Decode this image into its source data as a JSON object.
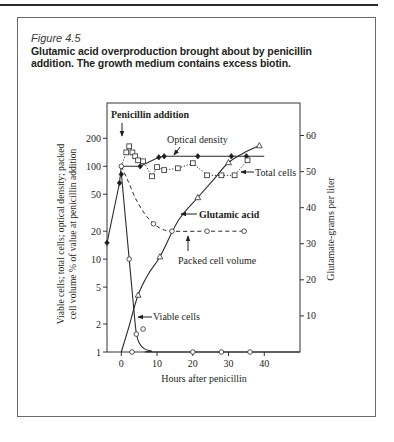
{
  "figure": {
    "label": "Figure 4.5",
    "caption_line1": "Glutamic acid overproduction brought about by penicillin",
    "caption_line2": "addition. The growth medium contains excess biotin."
  },
  "chart_data": {
    "type": "line",
    "title": "Glutamic acid overproduction brought about by penicillin addition. The growth medium contains excess biotin.",
    "xlabel": "Hours after penicillin",
    "ylabel": "Viable cells; total cells; optical density; packed cell volume % of value at penicillin addition",
    "ylabel_line1": "Viable cells; total cells; optical density; packed",
    "ylabel_line2": "cell volume % of value at penicillin addition",
    "y2label": "Glutamate-grams per liter",
    "xlim": [
      -4,
      50
    ],
    "xticks": [
      0,
      10,
      20,
      30,
      40
    ],
    "yscale": "log",
    "ylim": [
      1,
      480
    ],
    "yticks": [
      1,
      2,
      5,
      10,
      20,
      50,
      100,
      200
    ],
    "y2scale": "linear",
    "y2lim": [
      0,
      69
    ],
    "y2ticks": [
      10,
      20,
      30,
      40,
      50,
      60
    ],
    "grid": false,
    "legend": "inline annotations",
    "series": [
      {
        "name": "Optical density",
        "axis": "left",
        "marker": "filled-diamond",
        "line_style": "solid",
        "smooth": false,
        "points": [
          [
            -4,
            15
          ],
          [
            -0.5,
            66
          ],
          [
            0,
            82
          ],
          [
            5.3,
            100
          ],
          [
            10.5,
            125
          ],
          [
            12,
            128
          ],
          [
            21.4,
            128
          ],
          [
            30.8,
            128
          ],
          [
            35,
            128
          ]
        ],
        "line": [
          [
            -4,
            15
          ],
          [
            -0.5,
            66
          ],
          [
            0,
            100
          ],
          [
            5.3,
            100
          ],
          [
            10.5,
            125
          ],
          [
            12,
            128
          ],
          [
            40,
            128
          ]
        ]
      },
      {
        "name": "Total cells",
        "axis": "left",
        "marker": "open-square",
        "line_style": "dotted",
        "smooth": false,
        "points": [
          [
            1.4,
            141
          ],
          [
            2.2,
            164
          ],
          [
            3.1,
            141
          ],
          [
            3.9,
            128
          ],
          [
            4.7,
            116
          ],
          [
            6.1,
            113
          ],
          [
            8.6,
            78
          ],
          [
            10,
            98
          ],
          [
            12,
            91
          ],
          [
            15.8,
            95
          ],
          [
            20,
            108
          ],
          [
            24,
            80
          ],
          [
            28,
            80
          ],
          [
            31.7,
            80
          ],
          [
            35.3,
            116
          ]
        ],
        "line": [
          [
            0,
            100
          ],
          [
            1.4,
            141
          ],
          [
            2.2,
            164
          ],
          [
            3.1,
            141
          ],
          [
            3.9,
            128
          ],
          [
            4.7,
            116
          ],
          [
            6.1,
            113
          ],
          [
            8.6,
            78
          ],
          [
            10,
            98
          ],
          [
            12,
            91
          ],
          [
            15.8,
            95
          ],
          [
            20,
            108
          ],
          [
            24,
            80
          ],
          [
            28,
            80
          ],
          [
            31.7,
            80
          ],
          [
            35.3,
            116
          ]
        ]
      },
      {
        "name": "Viable cells",
        "axis": "left",
        "marker": "open-circle",
        "line_style": "solid",
        "smooth": true,
        "points": [
          [
            2.2,
            10
          ],
          [
            3,
            1
          ],
          [
            4.2,
            1.56
          ],
          [
            6.1,
            1.77
          ],
          [
            20,
            1
          ],
          [
            28,
            1
          ],
          [
            36,
            1
          ]
        ],
        "line": [
          [
            0,
            85
          ],
          [
            2.2,
            10
          ],
          [
            3.6,
            2.6
          ],
          [
            4.2,
            1.6
          ],
          [
            5,
            1.25
          ],
          [
            6.5,
            1.08
          ],
          [
            8.5,
            1.02
          ],
          [
            10,
            1
          ],
          [
            50,
            1
          ]
        ]
      },
      {
        "name": "Packed cell volume",
        "axis": "left",
        "marker": "open-circle",
        "line_style": "dashed",
        "smooth": true,
        "points": [
          [
            0,
            100
          ],
          [
            9,
            24
          ],
          [
            14.2,
            20
          ],
          [
            24,
            20
          ],
          [
            34.4,
            20
          ]
        ],
        "line": [
          [
            0,
            100
          ],
          [
            2,
            68
          ],
          [
            4,
            45
          ],
          [
            6.5,
            31
          ],
          [
            9,
            24
          ],
          [
            11.5,
            21
          ],
          [
            14.2,
            20
          ],
          [
            24,
            20
          ],
          [
            34.4,
            20
          ]
        ]
      },
      {
        "name": "Glutamic acid",
        "axis": "right",
        "marker": "open-triangle",
        "line_style": "solid",
        "smooth": true,
        "points": [
          [
            4.7,
            15.8
          ],
          [
            10.8,
            26.4
          ],
          [
            21.4,
            42.8
          ],
          [
            30,
            52.5
          ],
          [
            38.6,
            57.2
          ]
        ],
        "line": [
          [
            0,
            0
          ],
          [
            2,
            6.5
          ],
          [
            4.7,
            15.8
          ],
          [
            7.5,
            21.5
          ],
          [
            10.8,
            26.4
          ],
          [
            16,
            36.5
          ],
          [
            21.4,
            42.8
          ],
          [
            26,
            48
          ],
          [
            30,
            52.5
          ],
          [
            34.5,
            55.3
          ],
          [
            38.6,
            57.2
          ]
        ]
      }
    ],
    "annotations": [
      {
        "text": "Penicillin addition",
        "points_to": "x = 0"
      },
      {
        "text": "Optical density",
        "points_to": "Optical density"
      },
      {
        "text": "Total cells",
        "points_to": "Total cells"
      },
      {
        "text": "Glutamic acid",
        "points_to": "Glutamic acid"
      },
      {
        "text": "Packed cell volume",
        "points_to": "Packed cell volume"
      },
      {
        "text": "Viable cells",
        "points_to": "Viable cells"
      }
    ]
  }
}
